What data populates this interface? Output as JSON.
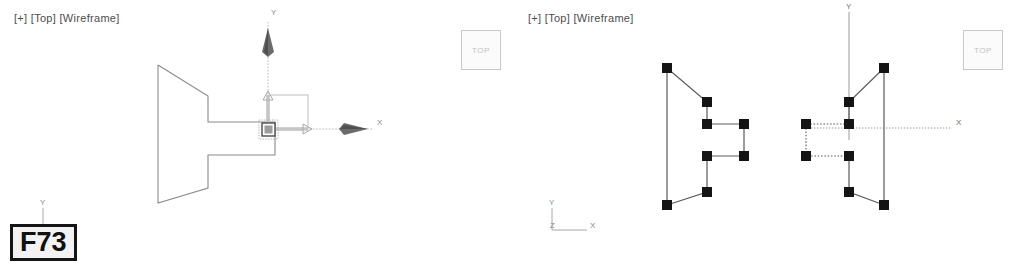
{
  "app": {
    "background_color": "#ffffff",
    "wire_color": "#7a7a7a",
    "vertex_color": "#141414",
    "axis_color": "#9a9a9a"
  },
  "viewports": [
    {
      "id": "left",
      "label": "[+] [Top] [Wireframe]",
      "label_x": 14,
      "label_y": 18,
      "shape": {
        "name": "spline-profile-outline",
        "points": "158,65 158,203 208,188 208,155 275,155 275,122 208,122 208,96 158,65",
        "stroke": "#8a8a8a",
        "fill": "none"
      },
      "gizmo": {
        "name": "move-transform-gizmo",
        "origin_x": 268,
        "origin_y": 129,
        "x_axis_label": "X",
        "y_axis_label": "Y",
        "x_axis_length": 112,
        "y_axis_length": 115,
        "plane_handle_size": 48
      },
      "axis_tripod": {
        "name": "world-axis-tripod",
        "x": 42,
        "y": 211,
        "labels": [
          "Y"
        ]
      },
      "badge": {
        "name": "frame-label-badge",
        "text": "F73",
        "x": 10,
        "y": 224
      }
    },
    {
      "id": "right",
      "label": "[+] [Top] [Wireframe]",
      "label_x": 528,
      "label_y": 18,
      "shapes": [
        {
          "name": "spline-profile-solid",
          "points": "667,68 667,205 707,192 707,156 744,156 744,124 707,124 707,102 667,68",
          "stroke": "#5c5c5c",
          "style": "solid"
        },
        {
          "name": "spline-profile-mirrored",
          "points": "884,68 884,205 849,192 849,156 806,156 806,124 849,124 849,102 884,68",
          "stroke": "#5c5c5c",
          "style": "mixed"
        }
      ],
      "vertices_solid": [
        [
          667,
          68
        ],
        [
          667,
          205
        ],
        [
          707,
          192
        ],
        [
          707,
          156
        ],
        [
          744,
          156
        ],
        [
          744,
          124
        ],
        [
          707,
          124
        ],
        [
          707,
          102
        ]
      ],
      "vertices_mirrored": [
        [
          884,
          68
        ],
        [
          884,
          205
        ],
        [
          849,
          192
        ],
        [
          849,
          156
        ],
        [
          806,
          156
        ],
        [
          806,
          124
        ],
        [
          849,
          124
        ],
        [
          849,
          102
        ]
      ],
      "axes": {
        "name": "viewport-axes",
        "origin_x": 849,
        "origin_y": 128,
        "y_label": "Y",
        "x_label": "X",
        "y_top": 10,
        "x_right": 960
      },
      "axis_tripod": {
        "name": "world-axis-tripod",
        "x": 550,
        "y": 205,
        "labels": [
          "Y",
          "Z",
          "X"
        ]
      }
    }
  ],
  "viewcubes": [
    {
      "name": "view-cube-top-left",
      "label": "TOP",
      "x": 461,
      "y": 30
    },
    {
      "name": "view-cube-top-right",
      "label": "TOP",
      "x": 963,
      "y": 30
    }
  ]
}
